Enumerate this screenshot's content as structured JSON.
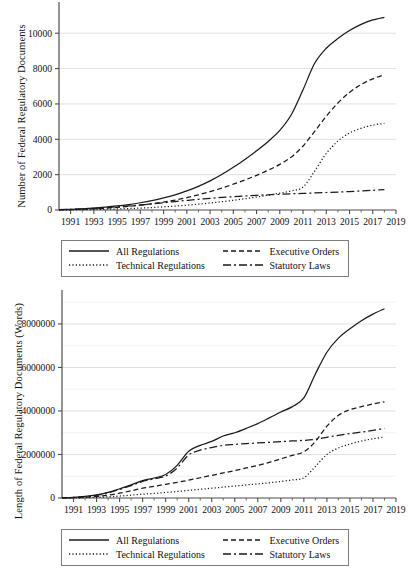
{
  "figure": {
    "panels": [
      "top",
      "bottom"
    ]
  },
  "legend": {
    "entries": [
      {
        "label": "All Regulations",
        "style": "solid"
      },
      {
        "label": "Executive Orders",
        "style": "dashed"
      },
      {
        "label": "Technical Regulations",
        "style": "dotted"
      },
      {
        "label": "Statutory Laws",
        "style": "dashdot"
      }
    ],
    "border_color": "#7d7d7d"
  },
  "colors": {
    "line": "#1a1a1a",
    "grid": "#d9d9d9",
    "axis": "#4d4d4d",
    "background": "#ffffff"
  },
  "chart_data": [
    {
      "type": "line",
      "id": "count-panel",
      "title": "",
      "xlabel": "",
      "ylabel": "Number of Federal Regulatory Documents",
      "xlim": [
        1990,
        2019
      ],
      "ylim": [
        0,
        11200
      ],
      "xticks": [
        1991,
        1993,
        1995,
        1997,
        1999,
        2001,
        2003,
        2005,
        2007,
        2009,
        2011,
        2013,
        2015,
        2017,
        2019
      ],
      "yticks": [
        0,
        2000,
        4000,
        6000,
        8000,
        10000
      ],
      "ytick_labels": [
        "0",
        "2000",
        "4000",
        "6000",
        "8000",
        "10000"
      ],
      "grid": true,
      "legend_position": "below",
      "x": [
        1990,
        1991,
        1992,
        1993,
        1994,
        1995,
        1996,
        1997,
        1998,
        1999,
        2000,
        2001,
        2002,
        2003,
        2004,
        2005,
        2006,
        2007,
        2008,
        2009,
        2010,
        2011,
        2012,
        2013,
        2014,
        2015,
        2016,
        2017,
        2018
      ],
      "series": [
        {
          "name": "All Regulations",
          "style": "solid",
          "values": [
            20,
            40,
            70,
            110,
            165,
            230,
            310,
            410,
            530,
            680,
            860,
            1080,
            1340,
            1650,
            2010,
            2420,
            2860,
            3350,
            3880,
            4500,
            5400,
            6800,
            8300,
            9150,
            9700,
            10150,
            10500,
            10750,
            10900
          ]
        },
        {
          "name": "Executive Orders",
          "style": "dashed",
          "values": [
            10,
            25,
            45,
            70,
            105,
            150,
            205,
            270,
            350,
            445,
            560,
            700,
            860,
            1040,
            1240,
            1460,
            1700,
            1960,
            2250,
            2580,
            3000,
            3620,
            4450,
            5300,
            6050,
            6650,
            7100,
            7420,
            7650
          ]
        },
        {
          "name": "Technical Regulations",
          "style": "dotted",
          "values": [
            5,
            10,
            18,
            28,
            42,
            60,
            82,
            108,
            140,
            178,
            222,
            272,
            330,
            395,
            468,
            548,
            636,
            732,
            836,
            950,
            1080,
            1300,
            2200,
            3200,
            3900,
            4350,
            4620,
            4800,
            4900
          ]
        },
        {
          "name": "Statutory Laws",
          "style": "dashdot",
          "values": [
            15,
            35,
            60,
            95,
            135,
            180,
            230,
            285,
            345,
            410,
            480,
            545,
            605,
            660,
            710,
            755,
            795,
            830,
            862,
            890,
            915,
            940,
            965,
            990,
            1015,
            1045,
            1080,
            1115,
            1150
          ]
        }
      ]
    },
    {
      "type": "line",
      "id": "length-panel",
      "title": "",
      "xlabel": "",
      "ylabel": "Length of Federal Regulatory Documents (Words)",
      "xlim": [
        1990,
        2019
      ],
      "ylim": [
        0,
        9100000
      ],
      "xticks": [
        1991,
        1993,
        1995,
        1997,
        1999,
        2001,
        2003,
        2005,
        2007,
        2009,
        2011,
        2013,
        2015,
        2017,
        2019
      ],
      "yticks": [
        0,
        2000000,
        4000000,
        6000000,
        8000000
      ],
      "ytick_labels": [
        "0",
        "2000000",
        "4000000",
        "6000000",
        "8000000"
      ],
      "grid": true,
      "legend_position": "below",
      "x": [
        1990,
        1991,
        1992,
        1993,
        1994,
        1995,
        1996,
        1997,
        1998,
        1999,
        2000,
        2001,
        2002,
        2003,
        2004,
        2005,
        2006,
        2007,
        2008,
        2009,
        2010,
        2011,
        2012,
        2013,
        2014,
        2015,
        2016,
        2017,
        2018
      ],
      "series": [
        {
          "name": "All Regulations",
          "style": "solid",
          "values": [
            10000,
            30000,
            70000,
            140000,
            260000,
            420000,
            600000,
            800000,
            920000,
            1080000,
            1500000,
            2150000,
            2420000,
            2600000,
            2850000,
            3000000,
            3200000,
            3420000,
            3680000,
            3950000,
            4200000,
            4600000,
            5700000,
            6700000,
            7350000,
            7780000,
            8150000,
            8450000,
            8700000
          ]
        },
        {
          "name": "Executive Orders",
          "style": "dashed",
          "values": [
            5000,
            15000,
            35000,
            70000,
            130000,
            220000,
            330000,
            450000,
            540000,
            630000,
            720000,
            820000,
            930000,
            1040000,
            1150000,
            1260000,
            1380000,
            1500000,
            1640000,
            1800000,
            1960000,
            2120000,
            2600000,
            3300000,
            3800000,
            4060000,
            4200000,
            4320000,
            4420000
          ]
        },
        {
          "name": "Technical Regulations",
          "style": "dotted",
          "values": [
            2000,
            6000,
            14000,
            30000,
            55000,
            90000,
            130000,
            175000,
            215000,
            255000,
            300000,
            350000,
            400000,
            450000,
            500000,
            550000,
            600000,
            650000,
            700000,
            760000,
            830000,
            930000,
            1450000,
            2000000,
            2300000,
            2480000,
            2620000,
            2720000,
            2800000
          ]
        },
        {
          "name": "Statutory Laws",
          "style": "dashdot",
          "values": [
            8000,
            25000,
            60000,
            120000,
            230000,
            390000,
            570000,
            760000,
            880000,
            1010000,
            1380000,
            1980000,
            2200000,
            2320000,
            2420000,
            2460000,
            2500000,
            2530000,
            2560000,
            2590000,
            2620000,
            2650000,
            2700000,
            2790000,
            2880000,
            2960000,
            3030000,
            3110000,
            3200000
          ]
        }
      ]
    }
  ]
}
